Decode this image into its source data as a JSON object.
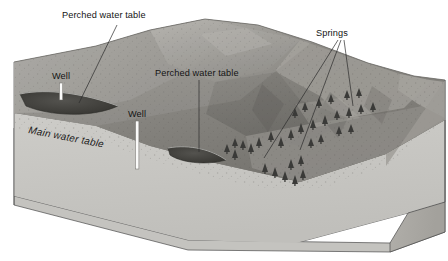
{
  "figure": {
    "background_color": "#ffffff",
    "width": 448,
    "height": 261
  },
  "labels": {
    "perched_water_table_upper": "Perched water table",
    "perched_water_table_lower": "Perched water table",
    "springs": "Springs",
    "well_left": "Well",
    "well_center": "Well",
    "main_water_table": "Main water table"
  },
  "colors": {
    "terrain_light": "#b4b2ad",
    "terrain_mid": "#8e8c87",
    "terrain_dark": "#6d6b67",
    "terrain_shadow": "#55534f",
    "cross_section_upper": "#a5a39e",
    "cross_section_saturated": "#c9c8c4",
    "block_side": "#b9b7b2",
    "block_front": "#c6c5c1",
    "perched_lens": "#3c3b39",
    "well_casing": "#fbfbfa",
    "tree": "#3a3a38",
    "outline": "#4a4a4a",
    "label_text": "#141414"
  },
  "features": {
    "wells_count": 2,
    "perched_lenses_count": 2,
    "springs_count": 3,
    "leader_lines_count": 5
  }
}
